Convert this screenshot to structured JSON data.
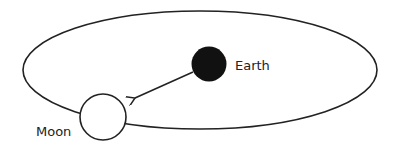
{
  "diagram": {
    "type": "orbit",
    "labels": {
      "earth": "Earth",
      "moon": "Moon"
    },
    "colors": {
      "stroke": "#222222",
      "earth_fill": "#111111",
      "moon_fill": "#ffffff",
      "background": "#ffffff"
    }
  }
}
